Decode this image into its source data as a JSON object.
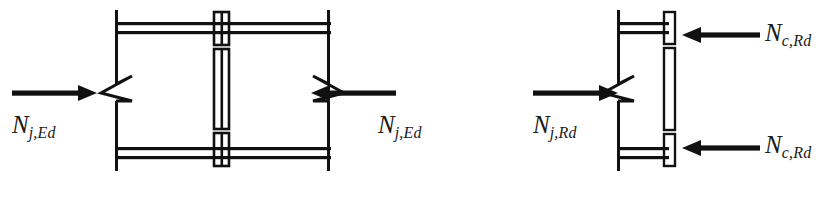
{
  "figure": {
    "stroke_color": "#111111",
    "background_color": "#ffffff"
  },
  "labels": {
    "left_force_in": {
      "symbol": "N",
      "subscript": "j,Ed"
    },
    "left_force_out": {
      "symbol": "N",
      "subscript": "j,Ed"
    },
    "right_force_in": {
      "symbol": "N",
      "subscript": "j,Rd"
    },
    "right_force_top": {
      "symbol": "N",
      "subscript": "c,Rd"
    },
    "right_force_bot": {
      "symbol": "N",
      "subscript": "c,Rd"
    }
  },
  "left_diagram": {
    "name": "bolted-splice-joint",
    "description": "I-section beam elevation with central bolted splice plate and break symbols on both webs",
    "arrows": [
      {
        "name": "arrow-left-inward",
        "direction": "right",
        "x_start": 12,
        "x_end": 97,
        "y": 93
      },
      {
        "name": "arrow-right-inward",
        "direction": "left",
        "x_start": 395,
        "x_end": 311,
        "y": 93
      }
    ]
  },
  "right_diagram": {
    "name": "end-plate-contact",
    "description": "I-section beam elevation with full-height end plate and two column resistance arrows",
    "arrows": [
      {
        "name": "arrow-right-inward",
        "direction": "right",
        "x_start": 533,
        "x_end": 618,
        "y": 93
      },
      {
        "name": "arrow-top-contact",
        "direction": "left",
        "x_start": 760,
        "x_end": 682,
        "y": 35
      },
      {
        "name": "arrow-bottom-contact",
        "direction": "left",
        "x_start": 760,
        "x_end": 682,
        "y": 148
      }
    ]
  }
}
